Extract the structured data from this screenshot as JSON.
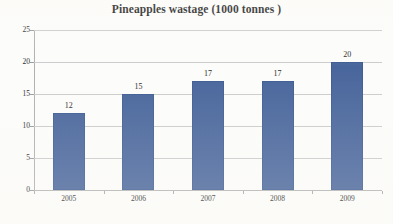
{
  "chart_data": {
    "type": "bar",
    "title": "Pineapples wastage (1000 tonnes )",
    "xlabel": "",
    "ylabel": "",
    "categories": [
      "2005",
      "2006",
      "2007",
      "2008",
      "2009"
    ],
    "values": [
      12,
      15,
      17,
      17,
      20
    ],
    "value_labels": [
      "12",
      "15",
      "17",
      "17",
      "20"
    ],
    "ylim": [
      0,
      25
    ],
    "ytick_labels": [
      "0",
      "5",
      "10",
      "15",
      "20",
      "25"
    ],
    "ytick_values": [
      0,
      5,
      10,
      15,
      20,
      25
    ],
    "grid": true,
    "legend": "none",
    "series": [
      {
        "name": "Pineapples wastage",
        "values": [
          12,
          15,
          17,
          17,
          20
        ]
      }
    ],
    "colors": {
      "bar": "#49669c",
      "bar_border": "#3f5d94",
      "gridline": "#cccccc",
      "axis": "#b0b0b0",
      "text": "#2b2b2b",
      "background": "#fcfcfa"
    }
  }
}
